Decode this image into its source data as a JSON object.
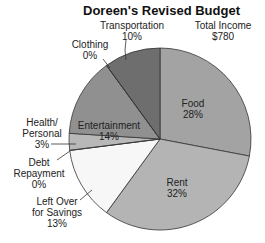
{
  "chart_data": {
    "type": "pie",
    "title": "Doreen's Revised Budget",
    "annotation": "Total Income $780",
    "annotation_lines": [
      "Total Income",
      "$780"
    ],
    "start_angle_deg": 0,
    "direction": "clockwise",
    "slices": [
      {
        "label": "Food",
        "value": 28,
        "pct": "28%",
        "color": "#a3a3a3"
      },
      {
        "label": "Rent",
        "value": 32,
        "pct": "32%",
        "color": "#b4b4b4"
      },
      {
        "label": "Left Over for Savings",
        "value": 13,
        "pct": "13%",
        "color": "#f7f7f7"
      },
      {
        "label": "Debt Repayment",
        "value": 0,
        "pct": "0%",
        "color": "#ffffff"
      },
      {
        "label": "Health/Personal",
        "value": 3,
        "pct": "3%",
        "color": "#b8b8b8"
      },
      {
        "label": "Entertainment",
        "value": 14,
        "pct": "14%",
        "color": "#909090"
      },
      {
        "label": "Clothing",
        "value": 0,
        "pct": "0%",
        "color": "#aaaaaa"
      },
      {
        "label": "Transportation",
        "value": 10,
        "pct": "10%",
        "color": "#6e6e6e"
      }
    ],
    "legend": "none (direct labels)"
  },
  "labels": {
    "food": {
      "name": "Food",
      "pct": "28%"
    },
    "rent": {
      "name": "Rent",
      "pct": "32%"
    },
    "savings": {
      "line1": "Left Over",
      "line2": "for Savings",
      "pct": "13%"
    },
    "debt": {
      "line1": "Debt",
      "line2": "Repayment",
      "pct": "0%"
    },
    "health": {
      "line1": "Health/",
      "line2": "Personal",
      "pct": "3%"
    },
    "entertainment": {
      "name": "Entertainment",
      "pct": "14%"
    },
    "clothing": {
      "name": "Clothing",
      "pct": "0%"
    },
    "transportation": {
      "name": "Transportation",
      "pct": "10%"
    },
    "total": {
      "line1": "Total Income",
      "line2": "$780"
    }
  }
}
